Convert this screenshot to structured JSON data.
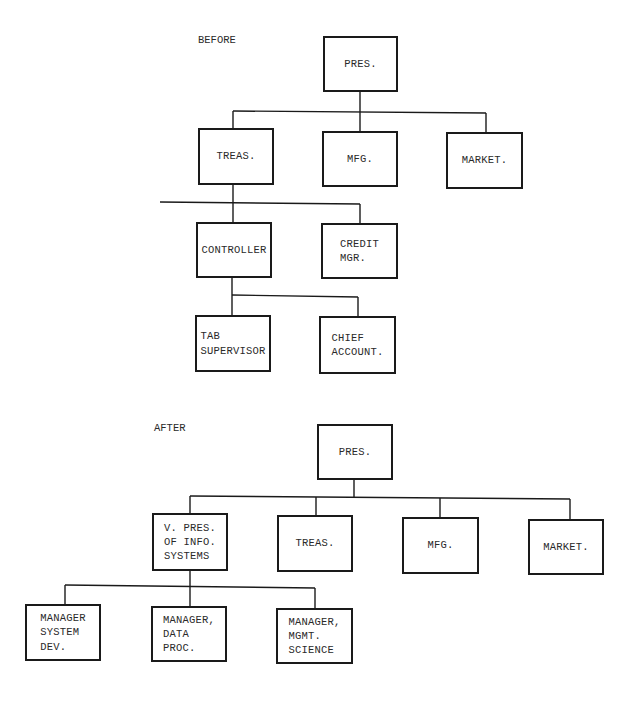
{
  "diagram": {
    "type": "organization-chart",
    "before": {
      "label": "BEFORE",
      "nodes": {
        "pres": "PRES.",
        "treas": "TREAS.",
        "mfg": "MFG.",
        "market": "MARKET.",
        "controller": "CONTROLLER",
        "credit_mgr": "CREDIT\nMGR.",
        "tab_supervisor": "TAB\nSUPERVISOR",
        "chief_account": "CHIEF\nACCOUNT."
      },
      "edges": [
        [
          "PRES.",
          "TREAS."
        ],
        [
          "PRES.",
          "MFG."
        ],
        [
          "PRES.",
          "MARKET."
        ],
        [
          "TREAS.",
          "CONTROLLER"
        ],
        [
          "TREAS.",
          "CREDIT MGR."
        ],
        [
          "CONTROLLER",
          "TAB SUPERVISOR"
        ],
        [
          "CONTROLLER",
          "CHIEF ACCOUNT."
        ]
      ]
    },
    "after": {
      "label": "AFTER",
      "nodes": {
        "pres": "PRES.",
        "vp_info_systems": "V. PRES.\nOF INFO.\nSYSTEMS",
        "treas": "TREAS.",
        "mfg": "MFG.",
        "market": "MARKET.",
        "mgr_system_dev": "MANAGER\nSYSTEM\nDEV.",
        "mgr_data_proc": "MANAGER,\nDATA\nPROC.",
        "mgr_mgmt_science": "MANAGER,\nMGMT.\nSCIENCE"
      },
      "edges": [
        [
          "PRES.",
          "V. PRES. OF INFO. SYSTEMS"
        ],
        [
          "PRES.",
          "TREAS."
        ],
        [
          "PRES.",
          "MFG."
        ],
        [
          "PRES.",
          "MARKET."
        ],
        [
          "V. PRES. OF INFO. SYSTEMS",
          "MANAGER SYSTEM DEV."
        ],
        [
          "V. PRES. OF INFO. SYSTEMS",
          "MANAGER, DATA PROC."
        ],
        [
          "V. PRES. OF INFO. SYSTEMS",
          "MANAGER, MGMT. SCIENCE"
        ]
      ]
    },
    "colors": {
      "line": "#1a1a1a",
      "text": "#2a2a2a",
      "background": "#ffffff"
    }
  }
}
